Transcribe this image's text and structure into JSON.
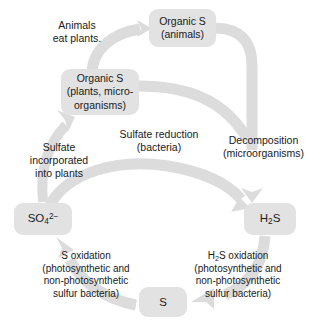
{
  "diagram": {
    "colors": {
      "node_fill": "#e2e2e2",
      "arrow_fill": "#dcdcdc",
      "text": "#1a1a1a",
      "background": "#ffffff"
    }
  },
  "nodes": {
    "organic_s_animals": {
      "name": "Organic S (animals)",
      "lines": [
        "Organic S",
        "(animals)"
      ]
    },
    "organic_s_plants": {
      "name": "Organic S (plants, microorganisms)",
      "lines": [
        "Organic S",
        "(plants, micro-",
        "organisms)"
      ]
    },
    "sulfate": {
      "name": "Sulfate ion",
      "formula_main": "SO",
      "formula_sub": "4",
      "formula_sup": "2−",
      "plain": "SO4 2-"
    },
    "hydrogen_sulfide": {
      "name": "Hydrogen sulfide",
      "formula_pre": "H",
      "formula_sub": "2",
      "formula_post": "S",
      "plain": "H2S"
    },
    "elemental_sulfur": {
      "name": "Elemental sulfur",
      "label": "S"
    }
  },
  "captions": {
    "animals_eat_plants": {
      "lines": [
        "Animals",
        "eat plants."
      ]
    },
    "sulfate_incorporated": {
      "lines": [
        "Sulfate",
        "incorporated",
        "into plants"
      ]
    },
    "sulfate_reduction": {
      "lines": [
        "Sulfate reduction",
        "(bacteria)"
      ]
    },
    "decomposition": {
      "lines": [
        "Decomposition",
        "(microorganisms)"
      ]
    },
    "s_oxidation": {
      "line1_main": "S oxidation",
      "lines_rest": [
        "(photosynthetic and",
        "non-photosynthetic",
        "sulfur bacteria)"
      ]
    },
    "h2s_oxidation": {
      "line1_pre": "H",
      "line1_sub": "2",
      "line1_post": "S oxidation",
      "lines_rest": [
        "(photosynthetic and",
        "non-photosynthetic",
        "sulfur bacteria)"
      ]
    }
  },
  "arrows": [
    {
      "name": "plants-to-animals",
      "from": "organic_s_plants",
      "to": "organic_s_animals",
      "label": "animals_eat_plants"
    },
    {
      "name": "animals-to-h2s",
      "from": "organic_s_animals",
      "to": "hydrogen_sulfide",
      "label": "decomposition"
    },
    {
      "name": "plants-to-h2s",
      "from": "organic_s_plants",
      "to": "hydrogen_sulfide",
      "label": "decomposition"
    },
    {
      "name": "sulfate-to-h2s",
      "from": "sulfate",
      "to": "hydrogen_sulfide",
      "label": "sulfate_reduction"
    },
    {
      "name": "h2s-to-sulfur",
      "from": "hydrogen_sulfide",
      "to": "elemental_sulfur",
      "label": "h2s_oxidation"
    },
    {
      "name": "sulfur-to-sulfate",
      "from": "elemental_sulfur",
      "to": "sulfate",
      "label": "s_oxidation"
    },
    {
      "name": "sulfate-to-plants",
      "from": "sulfate",
      "to": "organic_s_plants",
      "label": "sulfate_incorporated"
    }
  ]
}
